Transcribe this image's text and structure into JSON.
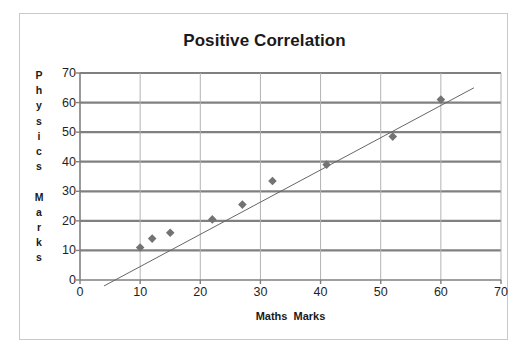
{
  "chart_data": {
    "type": "scatter",
    "title": "Positive Correlation",
    "xlabel": "Maths  Marks",
    "ylabel": "Physics Marks",
    "ylabel_letters": [
      "P",
      "h",
      "y",
      "s",
      "i",
      "c",
      "s",
      "",
      "M",
      "a",
      "r",
      "k",
      "s"
    ],
    "xlim": [
      0,
      70
    ],
    "ylim": [
      0,
      70
    ],
    "xticks": [
      0,
      10,
      20,
      30,
      40,
      50,
      60,
      70
    ],
    "yticks": [
      0,
      10,
      20,
      30,
      40,
      50,
      60,
      70
    ],
    "grid": {
      "horizontal": true,
      "vertical": true,
      "horizontal_color": "#808080",
      "vertical_color": "#b3b3b3"
    },
    "legend": null,
    "series": [
      {
        "name": "Marks",
        "marker": "diamond",
        "marker_color": "#737373",
        "points": [
          {
            "x": 10,
            "y": 11
          },
          {
            "x": 12,
            "y": 14
          },
          {
            "x": 15,
            "y": 16
          },
          {
            "x": 22,
            "y": 20.5
          },
          {
            "x": 27,
            "y": 25.5
          },
          {
            "x": 32,
            "y": 33.5
          },
          {
            "x": 41,
            "y": 39
          },
          {
            "x": 52,
            "y": 48.5
          },
          {
            "x": 60,
            "y": 61
          }
        ]
      }
    ],
    "trendline": {
      "type": "linear",
      "color": "#666666",
      "x_start": 4,
      "y_start": -2,
      "x_end": 65.5,
      "y_end": 65
    },
    "annotations": []
  },
  "colors": {
    "frame_border": "#c9c9c9",
    "axis_line": "#808080",
    "text": "#1a1a1a",
    "background": "#ffffff"
  }
}
